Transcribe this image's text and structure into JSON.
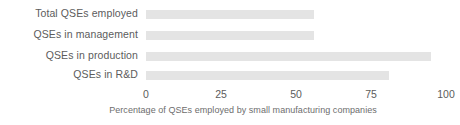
{
  "chart_data": {
    "type": "bar",
    "orientation": "horizontal",
    "title": "",
    "xlabel": "Percentage of QSEs employed by small manufacturing companies",
    "ylabel": "",
    "categories": [
      "Total QSEs employed",
      "QSEs in management",
      "QSEs in production",
      "QSEs in R&D"
    ],
    "values": [
      56,
      56,
      95,
      81
    ],
    "xlim": [
      0,
      100
    ],
    "xticks": [
      0,
      25,
      50,
      75,
      100
    ],
    "xtick_labels": [
      "0",
      "25",
      "50",
      "75",
      "100"
    ],
    "grid": false,
    "legend": null,
    "bar_color": "#e4e4e4",
    "text_color": "#5c5c5c",
    "background_color": "#ffffff"
  }
}
